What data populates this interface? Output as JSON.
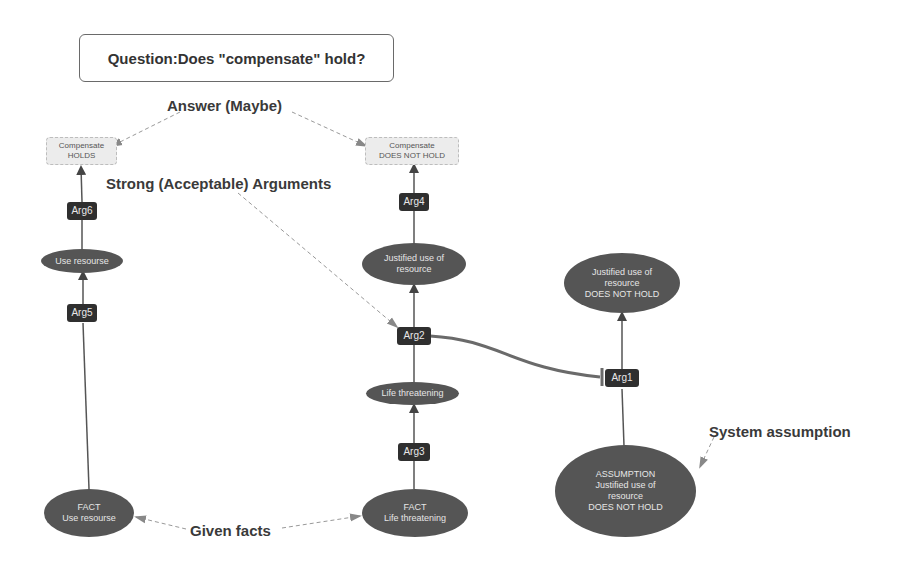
{
  "question": "Question:Does \"compensate\" hold?",
  "annotations": {
    "answer": "Answer (Maybe)",
    "strong_args": "Strong (Acceptable) Arguments",
    "system_assumption": "System assumption",
    "given_facts": "Given facts"
  },
  "conclusions": {
    "holds": {
      "line1": "Compensate",
      "line2": "HOLDS"
    },
    "not_holds": {
      "line1": "Compensate",
      "line2": "DOES NOT HOLD"
    }
  },
  "arguments": {
    "arg1": "Arg1",
    "arg2": "Arg2",
    "arg3": "Arg3",
    "arg4": "Arg4",
    "arg5": "Arg5",
    "arg6": "Arg6"
  },
  "propositions": {
    "use_resourse": "Use resourse",
    "justified_use": {
      "line1": "Justified use of",
      "line2": "resource"
    },
    "justified_not_hold": {
      "line1": "Justified use of",
      "line2": "resource",
      "line3": "DOES NOT HOLD"
    },
    "life_threatening": "Life threatening",
    "fact_use": {
      "line1": "FACT",
      "line2": "Use resourse"
    },
    "fact_life": {
      "line1": "FACT",
      "line2": "Life threatening"
    },
    "assumption": {
      "line1": "ASSUMPTION",
      "line2": "Justified use of",
      "line3": "resource",
      "line4": "DOES NOT HOLD"
    }
  },
  "colors": {
    "edge": "#555555",
    "dashed": "#999999",
    "arg_fill": "#2f2f2f",
    "prop_fill": "#555555",
    "attack_edge": "#6a6a6a"
  }
}
